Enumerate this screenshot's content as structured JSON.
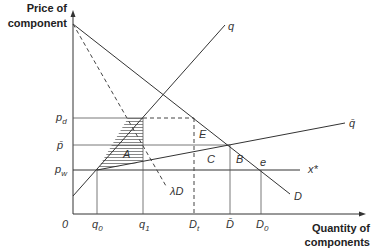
{
  "axes": {
    "y_title_line1": "Price of",
    "y_title_line2": "component",
    "x_title_line1": "Quantity of",
    "x_title_line2": "components",
    "origin": "0"
  },
  "y_ticks": [
    {
      "base": "p",
      "sub": "d"
    },
    {
      "base": "p̄",
      "sub": ""
    },
    {
      "base": "p",
      "sub": "w"
    }
  ],
  "x_ticks": [
    {
      "base": "q",
      "sub": "0"
    },
    {
      "base": "q",
      "sub": "1"
    },
    {
      "base": "D",
      "sub": "t"
    },
    {
      "base": "D̄",
      "sub": ""
    },
    {
      "base": "D",
      "sub": "0"
    }
  ],
  "curves": {
    "supply": "q",
    "supply_bar": "q̄",
    "world_price": "x*",
    "demand": "D",
    "lambda_demand": "λD"
  },
  "areas": {
    "A": "A",
    "B": "B",
    "C": "C",
    "E": "E",
    "e": "e"
  }
}
